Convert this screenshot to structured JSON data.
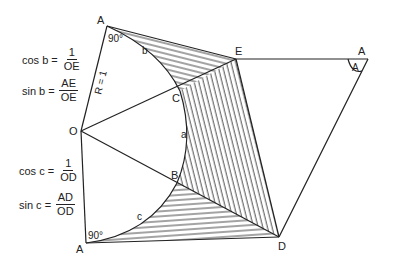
{
  "diagram": {
    "points": {
      "A_top": {
        "label": "A",
        "x": 107,
        "y": 26
      },
      "O": {
        "label": "O",
        "x": 81,
        "y": 131
      },
      "A_bottom": {
        "label": "A",
        "x": 86,
        "y": 243
      },
      "C": {
        "label": "C",
        "x": 180,
        "y": 91
      },
      "B": {
        "label": "B",
        "x": 177,
        "y": 183
      },
      "E": {
        "label": "E",
        "x": 236,
        "y": 59
      },
      "D": {
        "label": "D",
        "x": 279,
        "y": 237
      },
      "A_right": {
        "label": "A",
        "x": 368,
        "y": 59
      }
    },
    "labels": {
      "angle_top": "90°",
      "angle_bottom": "90°",
      "arc_b": "b",
      "arc_a": "a",
      "arc_c": "c",
      "radius": "R = 1",
      "angle_right": "A"
    },
    "formulas": [
      {
        "lhs": "cos b =",
        "num": "1",
        "den": "OE"
      },
      {
        "lhs": "sin b =",
        "num": "AE",
        "den": "OE"
      },
      {
        "lhs": "cos c =",
        "num": "1",
        "den": "OD"
      },
      {
        "lhs": "sin c =",
        "num": "AD",
        "den": "OD"
      }
    ]
  }
}
